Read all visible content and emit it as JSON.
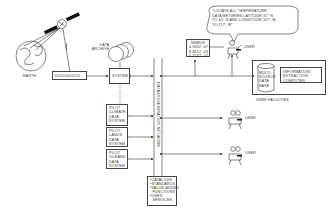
{
  "diagram": {
    "earth": {
      "label": "EARTH"
    },
    "satellite": {
      "icon": "satellite-icon"
    },
    "data_stream": {
      "label": "011010010111"
    },
    "data_archive": {
      "label": "DATA\nARCHIVE"
    },
    "system1": {
      "label": "SYSTEM 1"
    },
    "network": {
      "label": "DATA DISSEMINATION NETWORK"
    },
    "pilot_systems": [
      {
        "label": "PILOT\nCLIMATE\nDATA\nSYSTEM"
      },
      {
        "label": "PILOT\nLANDS\nDATA\nSYSTEM"
      },
      {
        "label": "PILOT\nOCEANS\nDATA\nSYSTEM"
      }
    ],
    "services_box": {
      "label": "•CATALOGS\n•STANDARDS\n•VALUE-ADDED\n  FUNCTIONS\n•USER\n  SERVICES"
    },
    "query_bubble": {
      "text": "\"LOCATE ALL TEMPERATURE\nDATA BETWEEN LATITUDE 32° N\nTO 45° N AND LONGITUDE 107° W\nTO 117° W\""
    },
    "result_box": {
      "label": "NNMUS\n4.9432 -07\n8.8612 -03\n5.7732 -02"
    },
    "users": [
      {
        "label": "USER"
      },
      {
        "label": "USER"
      },
      {
        "label": "USER"
      }
    ],
    "user_facilities": {
      "label": "USER FACILITIES",
      "database": "MULTI-\nSOURCE\nDATA\nBASE",
      "computer": "INFORMATION\nEXTRACTION\nCOMPUTER"
    }
  }
}
